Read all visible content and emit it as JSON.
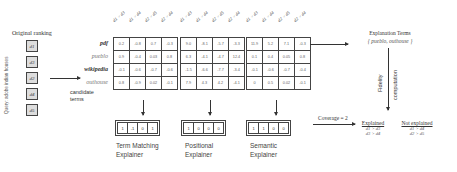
{
  "original_ranking": {
    "title": "Original ranking",
    "query_label": "Query: adobe indian houses",
    "docs": [
      "d1",
      "d3",
      "d2",
      "d4",
      "d5"
    ]
  },
  "terms": [
    {
      "label": "pdf",
      "style": "bold"
    },
    {
      "label": "pueblo",
      "style": "gray"
    },
    {
      "label": "wikipedia",
      "style": "bold"
    },
    {
      "label": "outhouse",
      "style": "gray"
    }
  ],
  "candidate_label": [
    "candidate",
    "terms"
  ],
  "column_pairs": [
    "d1 > d3",
    "d1 > d4",
    "d2 > d5",
    "d2 > d4"
  ],
  "matrices": [
    {
      "name": "term-matching",
      "rows": [
        [
          "0.2",
          "-0.8",
          "0.7",
          "-0.3"
        ],
        [
          "0.9",
          "-0.4",
          "0.03",
          "0.8"
        ],
        [
          "-0.1",
          "-0.6",
          "-0.7",
          "-0.6"
        ],
        [
          "0.8",
          "-0.9",
          "0.02",
          "-0.1"
        ]
      ],
      "vector": [
        "1",
        "-1",
        "0",
        "1"
      ],
      "explainer": [
        "Term Matching",
        "Explainer"
      ]
    },
    {
      "name": "positional",
      "rows": [
        [
          "9.0",
          "-8.1",
          "-5.7",
          "-3.3"
        ],
        [
          "6.3",
          "-4.1",
          "-4.7",
          "12.4"
        ],
        [
          "-1.5",
          "-6.6",
          "-7.7",
          "-3.4"
        ],
        [
          "7.9",
          "4.3",
          "4.2",
          "-4.1"
        ]
      ],
      "vector": [
        "1",
        "0",
        "0",
        "0"
      ],
      "explainer": [
        "Positional",
        "Explainer"
      ]
    },
    {
      "name": "semantic",
      "rows": [
        [
          "11.9",
          "5.2",
          "7.1",
          "-0.3"
        ],
        [
          "0.1",
          "0.4",
          "0.05",
          "0.8"
        ],
        [
          "-0.1",
          "-0.6",
          "-0.7",
          "-0.4"
        ],
        [
          "0",
          "0.5",
          "0.02",
          "-0.1"
        ]
      ],
      "vector": [
        "1",
        "1",
        "0",
        "0"
      ],
      "explainer": [
        "Semantic",
        "Explainer"
      ]
    }
  ],
  "explanation_terms": {
    "title": "Explanation Terms",
    "value": "{ pueblo, outhouse }"
  },
  "fidelity": {
    "line1": "Fidelity",
    "line2": "computation"
  },
  "coverage": "Coverage = 2",
  "results": {
    "explained_label": "Explained",
    "explained": [
      "d1 > d3",
      "d3 > d4"
    ],
    "not_explained_label": "Not explained",
    "not_explained": [
      "d1 > d4",
      "d2 > d5"
    ]
  }
}
